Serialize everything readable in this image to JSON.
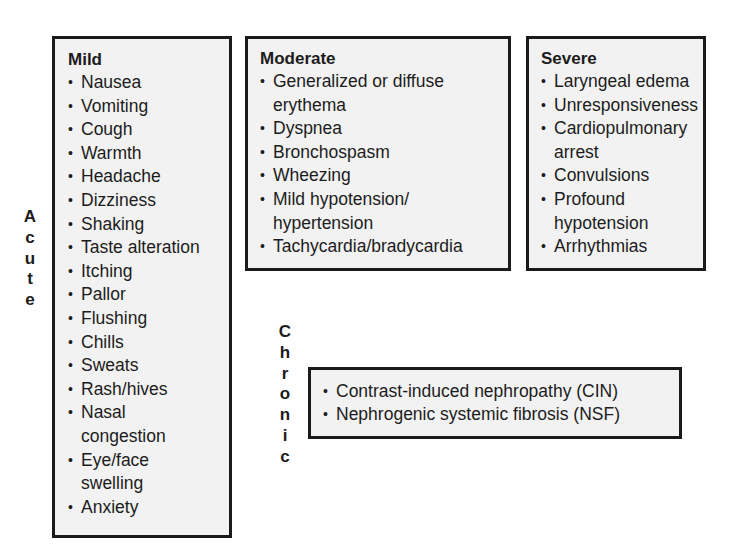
{
  "diagram": {
    "categories": {
      "acute": {
        "label": "Acute",
        "letters": [
          "A",
          "c",
          "u",
          "t",
          "e"
        ]
      },
      "chronic": {
        "label": "Chronic",
        "letters": [
          "C",
          "h",
          "r",
          "o",
          "n",
          "i",
          "c"
        ]
      }
    },
    "bullet": "•",
    "boxes": {
      "mild": {
        "title": "Mild",
        "items": [
          "Nausea",
          "Vomiting",
          "Cough",
          "Warmth",
          "Headache",
          "Dizziness",
          "Shaking",
          "Taste alteration",
          "Itching",
          "Pallor",
          "Flushing",
          "Chills",
          "Sweats",
          "Rash/hives",
          "Nasal congestion",
          "Eye/face swelling",
          "Anxiety"
        ]
      },
      "moderate": {
        "title": "Moderate",
        "items": [
          "Generalized or diffuse erythema",
          "Dyspnea",
          "Bronchospasm",
          "Wheezing",
          "Mild hypotension/ hypertension",
          "Tachycardia/bradycardia"
        ]
      },
      "severe": {
        "title": "Severe",
        "items": [
          "Laryngeal edema",
          "Unresponsiveness",
          "Cardiopulmonary arrest",
          "Convulsions",
          "Profound hypotension",
          "Arrhythmias"
        ]
      },
      "chronic": {
        "items": [
          "Contrast-induced nephropathy (CIN)",
          "Nephrogenic systemic fibrosis (NSF)"
        ]
      }
    }
  }
}
